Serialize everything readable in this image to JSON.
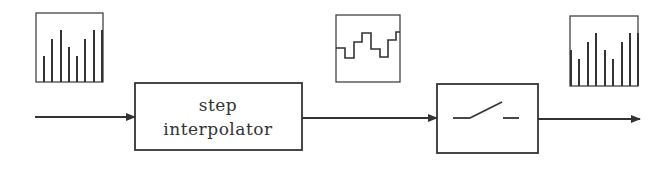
{
  "diagram": {
    "blocks": [
      {
        "id": "step-interpolator",
        "label_lines": [
          "step",
          "interpolator"
        ]
      },
      {
        "id": "sampler-switch",
        "label_lines": [],
        "icon": "switch-icon"
      }
    ],
    "signals": {
      "input": {
        "type": "discrete-samples",
        "heights": [
          0.43,
          0.67,
          0.79,
          0.55,
          0.43,
          0.67,
          0.79,
          0.79
        ]
      },
      "interpolated": {
        "type": "staircase"
      },
      "output": {
        "type": "discrete-samples",
        "heights": [
          0.55,
          0.43,
          0.67,
          0.79,
          0.55,
          0.43,
          0.67,
          0.79,
          0.79
        ]
      }
    },
    "colors": {
      "stroke": "#333333",
      "background": "#ffffff"
    }
  }
}
